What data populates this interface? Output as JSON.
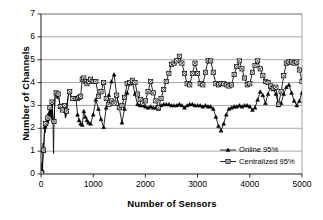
{
  "chart_data": {
    "type": "line",
    "title": "",
    "xlabel": "Number of Sensors",
    "ylabel": "Number of Channels",
    "xlim": [
      0,
      5000
    ],
    "ylim": [
      0,
      7
    ],
    "xticks": [
      0,
      1000,
      2000,
      3000,
      4000,
      5000
    ],
    "yticks": [
      0,
      1,
      2,
      3,
      4,
      5,
      6,
      7
    ],
    "grid": "horizontal",
    "legend_position": "lower-right-inside",
    "series": [
      {
        "name": "Online 95%",
        "marker": "triangle",
        "color": "#000000",
        "points": [
          [
            10,
            0.05
          ],
          [
            20,
            0.5
          ],
          [
            30,
            0.15
          ],
          [
            40,
            1.35
          ],
          [
            50,
            1.0
          ],
          [
            60,
            1.5
          ],
          [
            70,
            2.05
          ],
          [
            80,
            1.8
          ],
          [
            90,
            2.2
          ],
          [
            100,
            2.0
          ],
          [
            110,
            2.3
          ],
          [
            120,
            2.15
          ],
          [
            130,
            2.45
          ],
          [
            140,
            2.2
          ],
          [
            150,
            2.65
          ],
          [
            160,
            2.35
          ],
          [
            170,
            2.9
          ],
          [
            180,
            2.5
          ],
          [
            190,
            2.75
          ],
          [
            200,
            2.4
          ],
          [
            210,
            3.15
          ],
          [
            220,
            2.6
          ],
          [
            230,
            2.35
          ],
          [
            240,
            0.9
          ],
          [
            250,
            2.3
          ],
          [
            270,
            3.45
          ],
          [
            290,
            3.55
          ],
          [
            310,
            3.3
          ],
          [
            330,
            3.5
          ],
          [
            350,
            3.2
          ],
          [
            370,
            2.95
          ],
          [
            390,
            3.05
          ],
          [
            410,
            2.8
          ],
          [
            430,
            2.7
          ],
          [
            450,
            3.0
          ],
          [
            470,
            2.45
          ],
          [
            490,
            2.75
          ],
          [
            520,
            3.4
          ],
          [
            550,
            3.6
          ],
          [
            580,
            3.35
          ],
          [
            610,
            3.3
          ],
          [
            640,
            3.25
          ],
          [
            670,
            3.3
          ],
          [
            700,
            2.6
          ],
          [
            730,
            2.35
          ],
          [
            760,
            2.2
          ],
          [
            790,
            2.15
          ],
          [
            820,
            2.75
          ],
          [
            850,
            2.5
          ],
          [
            880,
            2.35
          ],
          [
            910,
            2.25
          ],
          [
            950,
            2.2
          ],
          [
            1000,
            2.6
          ],
          [
            1050,
            3.25
          ],
          [
            1100,
            2.85
          ],
          [
            1150,
            2.4
          ],
          [
            1200,
            2.05
          ],
          [
            1250,
            2.9
          ],
          [
            1300,
            3.45
          ],
          [
            1350,
            4.05
          ],
          [
            1400,
            4.35
          ],
          [
            1450,
            3.45
          ],
          [
            1500,
            2.9
          ],
          [
            1550,
            2.25
          ],
          [
            1600,
            2.85
          ],
          [
            1650,
            3.55
          ],
          [
            1700,
            3.95
          ],
          [
            1750,
            4.05
          ],
          [
            1800,
            3.5
          ],
          [
            1850,
            3.05
          ],
          [
            1900,
            3.0
          ],
          [
            1950,
            3.0
          ],
          [
            2000,
            2.95
          ],
          [
            2050,
            2.9
          ],
          [
            2100,
            2.95
          ],
          [
            2150,
            2.9
          ],
          [
            2200,
            2.9
          ],
          [
            2250,
            2.85
          ],
          [
            2300,
            3.0
          ],
          [
            2350,
            3.05
          ],
          [
            2400,
            3.05
          ],
          [
            2450,
            3.05
          ],
          [
            2500,
            3.0
          ],
          [
            2550,
            3.0
          ],
          [
            2600,
            3.0
          ],
          [
            2650,
            3.05
          ],
          [
            2700,
            3.0
          ],
          [
            2750,
            2.9
          ],
          [
            2800,
            3.0
          ],
          [
            2850,
            3.05
          ],
          [
            2900,
            3.05
          ],
          [
            2950,
            3.0
          ],
          [
            3000,
            3.0
          ],
          [
            3050,
            3.0
          ],
          [
            3100,
            2.95
          ],
          [
            3150,
            3.0
          ],
          [
            3200,
            2.95
          ],
          [
            3250,
            2.95
          ],
          [
            3300,
            2.85
          ],
          [
            3350,
            2.5
          ],
          [
            3400,
            2.1
          ],
          [
            3450,
            1.9
          ],
          [
            3500,
            2.2
          ],
          [
            3550,
            2.6
          ],
          [
            3600,
            2.85
          ],
          [
            3650,
            2.9
          ],
          [
            3700,
            2.95
          ],
          [
            3750,
            2.95
          ],
          [
            3800,
            3.0
          ],
          [
            3850,
            2.95
          ],
          [
            3900,
            3.0
          ],
          [
            3950,
            3.0
          ],
          [
            4000,
            2.95
          ],
          [
            4050,
            2.8
          ],
          [
            4100,
            2.9
          ],
          [
            4150,
            3.25
          ],
          [
            4200,
            3.6
          ],
          [
            4250,
            3.45
          ],
          [
            4300,
            3.1
          ],
          [
            4350,
            3.5
          ],
          [
            4400,
            3.8
          ],
          [
            4450,
            3.7
          ],
          [
            4500,
            3.5
          ],
          [
            4550,
            3.0
          ],
          [
            4600,
            3.1
          ],
          [
            4650,
            3.5
          ],
          [
            4700,
            3.8
          ],
          [
            4750,
            3.9
          ],
          [
            4800,
            3.55
          ],
          [
            4850,
            3.2
          ],
          [
            4900,
            3.0
          ],
          [
            4950,
            3.2
          ],
          [
            5000,
            3.55
          ]
        ]
      },
      {
        "name": "Centralized 95%",
        "marker": "square",
        "color": "#000000",
        "points": [
          [
            10,
            0.05
          ],
          [
            30,
            0.5
          ],
          [
            50,
            1.05
          ],
          [
            70,
            2.05
          ],
          [
            90,
            2.2
          ],
          [
            110,
            2.3
          ],
          [
            130,
            2.45
          ],
          [
            150,
            2.65
          ],
          [
            170,
            2.9
          ],
          [
            190,
            2.75
          ],
          [
            210,
            3.15
          ],
          [
            230,
            2.35
          ],
          [
            250,
            2.3
          ],
          [
            270,
            3.45
          ],
          [
            290,
            3.55
          ],
          [
            310,
            3.3
          ],
          [
            330,
            3.5
          ],
          [
            350,
            3.2
          ],
          [
            370,
            2.95
          ],
          [
            390,
            3.05
          ],
          [
            410,
            2.8
          ],
          [
            430,
            2.7
          ],
          [
            450,
            3.0
          ],
          [
            470,
            2.45
          ],
          [
            490,
            2.75
          ],
          [
            520,
            3.4
          ],
          [
            550,
            3.6
          ],
          [
            580,
            3.35
          ],
          [
            610,
            3.3
          ],
          [
            640,
            3.25
          ],
          [
            670,
            3.3
          ],
          [
            700,
            3.3
          ],
          [
            730,
            3.35
          ],
          [
            760,
            3.4
          ],
          [
            790,
            4.15
          ],
          [
            820,
            4.2
          ],
          [
            850,
            4.05
          ],
          [
            880,
            3.95
          ],
          [
            910,
            4.05
          ],
          [
            950,
            4.15
          ],
          [
            1000,
            4.05
          ],
          [
            1050,
            4.05
          ],
          [
            1100,
            3.4
          ],
          [
            1150,
            3.6
          ],
          [
            1200,
            4.0
          ],
          [
            1250,
            3.3
          ],
          [
            1300,
            3.05
          ],
          [
            1350,
            3.2
          ],
          [
            1400,
            3.1
          ],
          [
            1450,
            3.45
          ],
          [
            1500,
            2.9
          ],
          [
            1550,
            3.0
          ],
          [
            1600,
            3.35
          ],
          [
            1650,
            3.95
          ],
          [
            1700,
            4.0
          ],
          [
            1750,
            4.1
          ],
          [
            1800,
            4.0
          ],
          [
            1850,
            3.5
          ],
          [
            1900,
            3.25
          ],
          [
            1950,
            3.1
          ],
          [
            2000,
            3.2
          ],
          [
            2050,
            3.6
          ],
          [
            2100,
            4.05
          ],
          [
            2150,
            3.55
          ],
          [
            2200,
            3.2
          ],
          [
            2250,
            2.9
          ],
          [
            2300,
            3.3
          ],
          [
            2350,
            3.7
          ],
          [
            2400,
            4.05
          ],
          [
            2450,
            4.4
          ],
          [
            2500,
            4.8
          ],
          [
            2550,
            4.85
          ],
          [
            2600,
            4.95
          ],
          [
            2650,
            5.15
          ],
          [
            2700,
            4.85
          ],
          [
            2750,
            4.4
          ],
          [
            2800,
            3.95
          ],
          [
            2850,
            3.9
          ],
          [
            2900,
            4.4
          ],
          [
            2950,
            4.85
          ],
          [
            3000,
            4.4
          ],
          [
            3050,
            3.95
          ],
          [
            3100,
            3.9
          ],
          [
            3150,
            4.45
          ],
          [
            3200,
            4.95
          ],
          [
            3250,
            4.95
          ],
          [
            3300,
            4.45
          ],
          [
            3350,
            3.95
          ],
          [
            3400,
            3.9
          ],
          [
            3450,
            3.95
          ],
          [
            3500,
            3.95
          ],
          [
            3550,
            3.9
          ],
          [
            3600,
            3.85
          ],
          [
            3650,
            3.9
          ],
          [
            3700,
            4.35
          ],
          [
            3750,
            4.7
          ],
          [
            3800,
            4.95
          ],
          [
            3850,
            4.6
          ],
          [
            3900,
            4.2
          ],
          [
            3950,
            3.9
          ],
          [
            4000,
            3.95
          ],
          [
            4050,
            4.45
          ],
          [
            4100,
            4.75
          ],
          [
            4150,
            4.95
          ],
          [
            4200,
            4.6
          ],
          [
            4250,
            4.3
          ],
          [
            4300,
            4.05
          ],
          [
            4350,
            4.0
          ],
          [
            4400,
            3.85
          ],
          [
            4450,
            3.75
          ],
          [
            4500,
            3.8
          ],
          [
            4550,
            3.05
          ],
          [
            4600,
            3.6
          ],
          [
            4650,
            4.3
          ],
          [
            4700,
            4.85
          ],
          [
            4750,
            4.9
          ],
          [
            4800,
            4.9
          ],
          [
            4850,
            4.85
          ],
          [
            4900,
            4.9
          ],
          [
            4950,
            4.55
          ],
          [
            5000,
            4.05
          ]
        ]
      }
    ]
  },
  "legend": {
    "items": [
      {
        "label": "Online 95%",
        "marker": "triangle-marker-icon"
      },
      {
        "label": "Centralized 95%",
        "marker": "square-marker-icon"
      }
    ]
  },
  "axes": {
    "x_tick_labels": [
      "0",
      "1000",
      "2000",
      "3000",
      "4000",
      "5000"
    ],
    "y_tick_labels": [
      "0",
      "1",
      "2",
      "3",
      "4",
      "5",
      "6",
      "7"
    ],
    "x_title": "Number of Sensors",
    "y_title": "Number of Channels"
  }
}
